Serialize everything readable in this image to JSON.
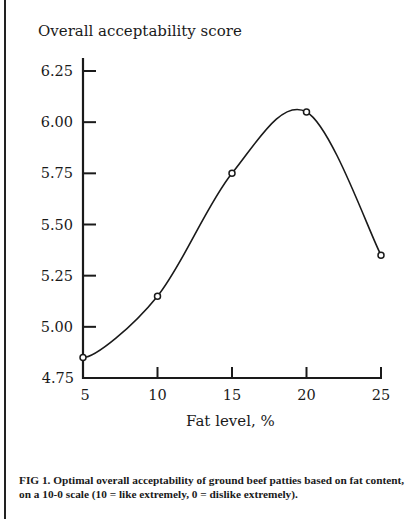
{
  "figure": {
    "y_axis_title": "Overall acceptability score",
    "x_axis_title": "Fat level, %",
    "caption": "FIG 1. Optimal overall acceptability of ground beef patties based on fat content, on a 10-0 scale (10 = like extremely, 0 = dislike extremely)."
  },
  "chart_data": {
    "type": "line",
    "title": "",
    "xlabel": "Fat level, %",
    "ylabel": "Overall acceptability score",
    "x": [
      5,
      10,
      15,
      20,
      25
    ],
    "series": [
      {
        "name": "Overall acceptability",
        "values": [
          4.85,
          5.15,
          5.75,
          6.05,
          5.35
        ]
      }
    ],
    "x_ticks": [
      "5",
      "10",
      "15",
      "20",
      "25"
    ],
    "y_ticks": [
      "4.75",
      "5.00",
      "5.25",
      "5.50",
      "5.75",
      "6.00",
      "6.25"
    ],
    "xlim": [
      5,
      25
    ],
    "ylim": [
      4.75,
      6.25
    ],
    "grid": false,
    "legend": "none",
    "markers": "open circle",
    "curve": "smoothed"
  }
}
